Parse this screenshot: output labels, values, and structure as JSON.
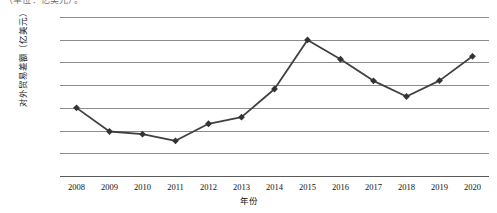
{
  "caption_top": "（单位：亿美元）。",
  "chart_data": {
    "type": "line",
    "title": "",
    "xlabel": "年份",
    "ylabel": "对外贸易差额（亿美元）",
    "categories": [
      "2008",
      "2009",
      "2010",
      "2011",
      "2012",
      "2013",
      "2014",
      "2015",
      "2016",
      "2017",
      "2018",
      "2019",
      "2020"
    ],
    "values": [
      3000,
      1960,
      1840,
      1550,
      2300,
      2590,
      3830,
      5990,
      5140,
      4190,
      3500,
      4200,
      5270
    ],
    "ylim": [
      0,
      7000
    ],
    "yticks": [
      "0",
      "1000",
      "2000",
      "3000",
      "4000",
      "5000",
      "6000",
      "7000"
    ],
    "ytick_values": [
      0,
      1000,
      2000,
      3000,
      4000,
      5000,
      6000,
      7000
    ],
    "grid": true,
    "legend": "none",
    "series": [
      {
        "name": "对外贸易差额",
        "values": [
          3000,
          1960,
          1840,
          1550,
          2300,
          2590,
          3830,
          5990,
          5140,
          4190,
          3500,
          4200,
          5270
        ]
      }
    ],
    "colors": {
      "line": "#404040",
      "marker": "#333333",
      "grid": "#8c8c8c",
      "axis": "#5a5a5a"
    }
  }
}
